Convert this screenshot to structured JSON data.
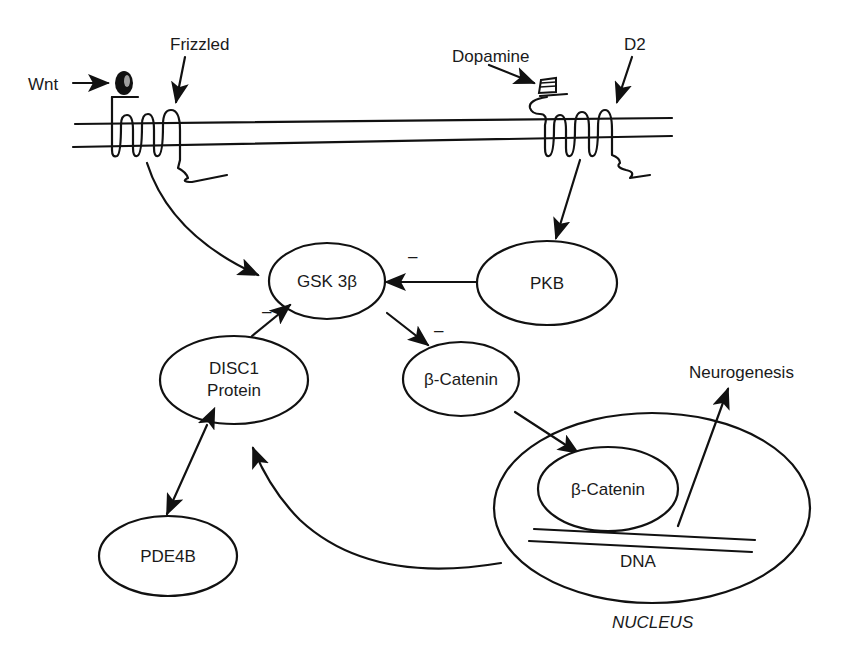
{
  "diagram": {
    "membrane_labels": {
      "wnt": "Wnt",
      "frizzled": "Frizzled",
      "dopamine": "Dopamine",
      "d2": "D2"
    },
    "nodes": {
      "gsk3b": "GSK 3β",
      "pkb": "PKB",
      "beta_catenin_cyto": "β-Catenin",
      "disc1_line1": "DISC1",
      "disc1_line2": "Protein",
      "pde4b": "PDE4B",
      "beta_catenin_nuc": "β-Catenin",
      "dna": "DNA",
      "nucleus": "NUCLEUS",
      "neurogenesis": "Neurogenesis"
    },
    "inhibition_marks": {
      "pkb_to_gsk": "–",
      "disc1_to_gsk": "–",
      "gsk_to_catenin": "–"
    },
    "edges": [
      {
        "from": "Frizzled",
        "to": "GSK 3β",
        "type": "arrow"
      },
      {
        "from": "D2",
        "to": "PKB",
        "type": "arrow"
      },
      {
        "from": "PKB",
        "to": "GSK 3β",
        "type": "inhibit"
      },
      {
        "from": "DISC1 Protein",
        "to": "GSK 3β",
        "type": "inhibit"
      },
      {
        "from": "GSK 3β",
        "to": "β-Catenin",
        "type": "inhibit"
      },
      {
        "from": "β-Catenin",
        "to": "Nucleus β-Catenin",
        "type": "arrow"
      },
      {
        "from": "DNA",
        "to": "Neurogenesis",
        "type": "arrow"
      },
      {
        "from": "Nucleus",
        "to": "DISC1 Protein",
        "type": "arrow"
      },
      {
        "from": "DISC1 Protein",
        "to": "PDE4B",
        "type": "bidirectional"
      }
    ]
  }
}
